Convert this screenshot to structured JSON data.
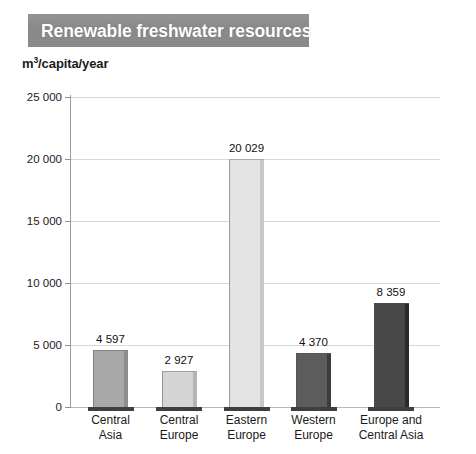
{
  "header": {
    "title": "Renewable freshwater resources",
    "banner_color": "#8c8c8c",
    "title_color": "#ffffff"
  },
  "axis_caption": {
    "prefix": "m",
    "superscript": "3",
    "suffix": "/capita/year",
    "full": "m3/capita/year"
  },
  "chart_data": {
    "type": "bar",
    "title": "Renewable freshwater resources",
    "xlabel": "",
    "ylabel": "m3/capita/year",
    "ylim": [
      0,
      25000
    ],
    "ytick_labels": [
      "0",
      "5 000",
      "10 000",
      "15 000",
      "20 000",
      "25 000"
    ],
    "ytick_values": [
      0,
      5000,
      10000,
      15000,
      20000,
      25000
    ],
    "grid": true,
    "legend": "none",
    "categories": [
      "Central Asia",
      "Central Europe",
      "Eastern Europe",
      "Western Europe",
      "Europe and Central Asia"
    ],
    "category_lines": [
      [
        "Central",
        "Asia"
      ],
      [
        "Central",
        "Europe"
      ],
      [
        "Eastern",
        "Europe"
      ],
      [
        "Western",
        "Europe"
      ],
      [
        "Europe and",
        "Central Asia"
      ]
    ],
    "values": [
      4597,
      2927,
      20029,
      4370,
      8359
    ],
    "value_labels": [
      "4 597",
      "2 927",
      "20 029",
      "4 370",
      "8 359"
    ],
    "bar_colors": [
      "#a9a9a9",
      "#dcdcdc",
      "#ececec",
      "#525252",
      "#3a3a3a"
    ],
    "bar_edge_colors": [
      "#8d8d8d",
      "#b5b5b5",
      "#c7c7c7",
      "#3c3c3c",
      "#2a2a2a"
    ]
  }
}
